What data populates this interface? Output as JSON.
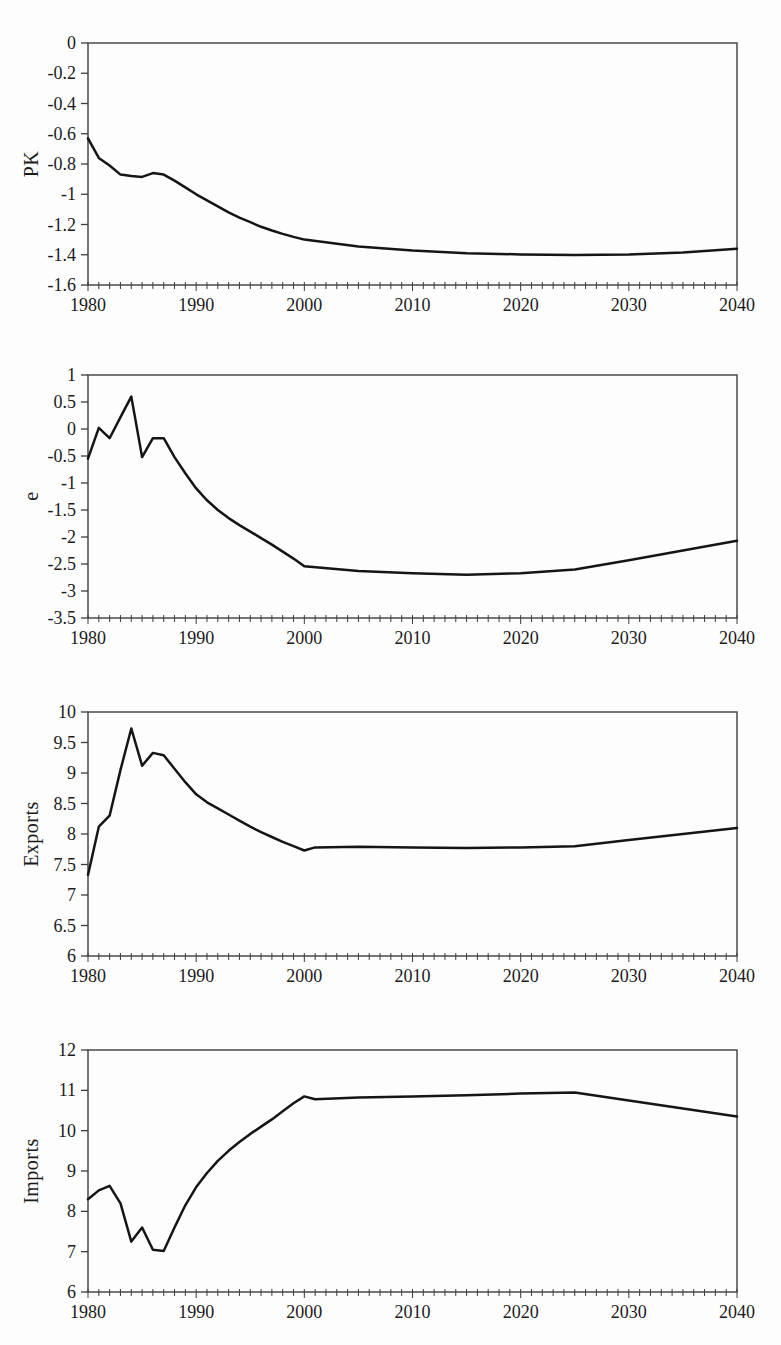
{
  "style": {
    "background": "#fdfdfd",
    "line_color": "#151515",
    "axis_color": "#3d3d3d",
    "text_color": "#1b1b1b"
  },
  "chart_data": [
    {
      "type": "line",
      "title": "",
      "xlabel": "",
      "ylabel": "PK",
      "xlim": [
        1980,
        2040
      ],
      "ylim": [
        -1.6,
        0
      ],
      "grid": false,
      "legend": "none",
      "xticks": [
        1980,
        1990,
        2000,
        2010,
        2020,
        2030,
        2040
      ],
      "x_minor_step": 1,
      "ytick_labels": [
        "0",
        "-0.2",
        "-0.4",
        "-0.6",
        "-0.8",
        "-1",
        "-1.2",
        "-1.4",
        "-1.6"
      ],
      "x": [
        1980,
        1981,
        1982,
        1983,
        1984,
        1985,
        1986,
        1987,
        1988,
        1989,
        1990,
        1991,
        1992,
        1993,
        1994,
        1995,
        1996,
        1997,
        1998,
        1999,
        2000,
        2005,
        2010,
        2015,
        2020,
        2025,
        2030,
        2035,
        2040
      ],
      "y": [
        -0.63,
        -0.76,
        -0.81,
        -0.87,
        -0.88,
        -0.885,
        -0.86,
        -0.87,
        -0.91,
        -0.955,
        -1.0,
        -1.04,
        -1.08,
        -1.12,
        -1.155,
        -1.185,
        -1.215,
        -1.24,
        -1.262,
        -1.282,
        -1.3,
        -1.345,
        -1.372,
        -1.39,
        -1.398,
        -1.402,
        -1.398,
        -1.385,
        -1.36
      ]
    },
    {
      "type": "line",
      "title": "",
      "xlabel": "",
      "ylabel": "e",
      "xlim": [
        1980,
        2040
      ],
      "ylim": [
        -3.5,
        1
      ],
      "grid": false,
      "legend": "none",
      "xticks": [
        1980,
        1990,
        2000,
        2010,
        2020,
        2030,
        2040
      ],
      "x_minor_step": 1,
      "ytick_labels": [
        "1",
        "0.5",
        "0",
        "-0.5",
        "-1",
        "-1.5",
        "-2",
        "-2.5",
        "-3",
        "-3.5"
      ],
      "x": [
        1980,
        1981,
        1982,
        1983,
        1984,
        1985,
        1986,
        1987,
        1988,
        1989,
        1990,
        1991,
        1992,
        1993,
        1994,
        1995,
        1996,
        1997,
        1998,
        1999,
        2000,
        2005,
        2010,
        2015,
        2020,
        2025,
        2030,
        2035,
        2040
      ],
      "y": [
        -0.55,
        0.02,
        -0.17,
        0.22,
        0.6,
        -0.52,
        -0.17,
        -0.17,
        -0.52,
        -0.82,
        -1.1,
        -1.32,
        -1.5,
        -1.65,
        -1.78,
        -1.9,
        -2.02,
        -2.14,
        -2.27,
        -2.4,
        -2.54,
        -2.63,
        -2.67,
        -2.7,
        -2.67,
        -2.6,
        -2.43,
        -2.25,
        -2.07
      ]
    },
    {
      "type": "line",
      "title": "",
      "xlabel": "",
      "ylabel": "Exports",
      "xlim": [
        1980,
        2040
      ],
      "ylim": [
        6,
        10
      ],
      "grid": false,
      "legend": "none",
      "xticks": [
        1980,
        1990,
        2000,
        2010,
        2020,
        2030,
        2040
      ],
      "x_minor_step": 1,
      "ytick_labels": [
        "10",
        "9.5",
        "9",
        "8.5",
        "8",
        "7.5",
        "7",
        "6.5",
        "6"
      ],
      "x": [
        1980,
        1981,
        1982,
        1983,
        1984,
        1985,
        1986,
        1987,
        1988,
        1989,
        1990,
        1991,
        1992,
        1993,
        1994,
        1995,
        1996,
        1997,
        1998,
        1999,
        2000,
        2001,
        2005,
        2010,
        2015,
        2020,
        2025,
        2030,
        2035,
        2040
      ],
      "y": [
        7.33,
        8.12,
        8.3,
        9.05,
        9.73,
        9.12,
        9.33,
        9.29,
        9.07,
        8.85,
        8.65,
        8.52,
        8.42,
        8.32,
        8.22,
        8.12,
        8.03,
        7.95,
        7.87,
        7.8,
        7.73,
        7.78,
        7.79,
        7.78,
        7.77,
        7.78,
        7.8,
        7.9,
        8.0,
        8.1
      ]
    },
    {
      "type": "line",
      "title": "",
      "xlabel": "",
      "ylabel": "Imports",
      "xlim": [
        1980,
        2040
      ],
      "ylim": [
        6,
        12
      ],
      "grid": false,
      "legend": "none",
      "xticks": [
        1980,
        1990,
        2000,
        2010,
        2020,
        2030,
        2040
      ],
      "x_minor_step": 1,
      "ytick_labels": [
        "12",
        "11",
        "10",
        "9",
        "8",
        "7",
        "6"
      ],
      "x": [
        1980,
        1981,
        1982,
        1983,
        1984,
        1985,
        1986,
        1987,
        1988,
        1989,
        1990,
        1991,
        1992,
        1993,
        1994,
        1995,
        1996,
        1997,
        1998,
        1999,
        2000,
        2001,
        2005,
        2010,
        2015,
        2020,
        2025,
        2030,
        2035,
        2040
      ],
      "y": [
        8.3,
        8.52,
        8.63,
        8.2,
        7.25,
        7.6,
        7.05,
        7.02,
        7.6,
        8.15,
        8.6,
        8.95,
        9.25,
        9.5,
        9.72,
        9.92,
        10.1,
        10.28,
        10.48,
        10.68,
        10.85,
        10.78,
        10.82,
        10.85,
        10.88,
        10.92,
        10.95,
        10.75,
        10.55,
        10.35
      ]
    }
  ]
}
